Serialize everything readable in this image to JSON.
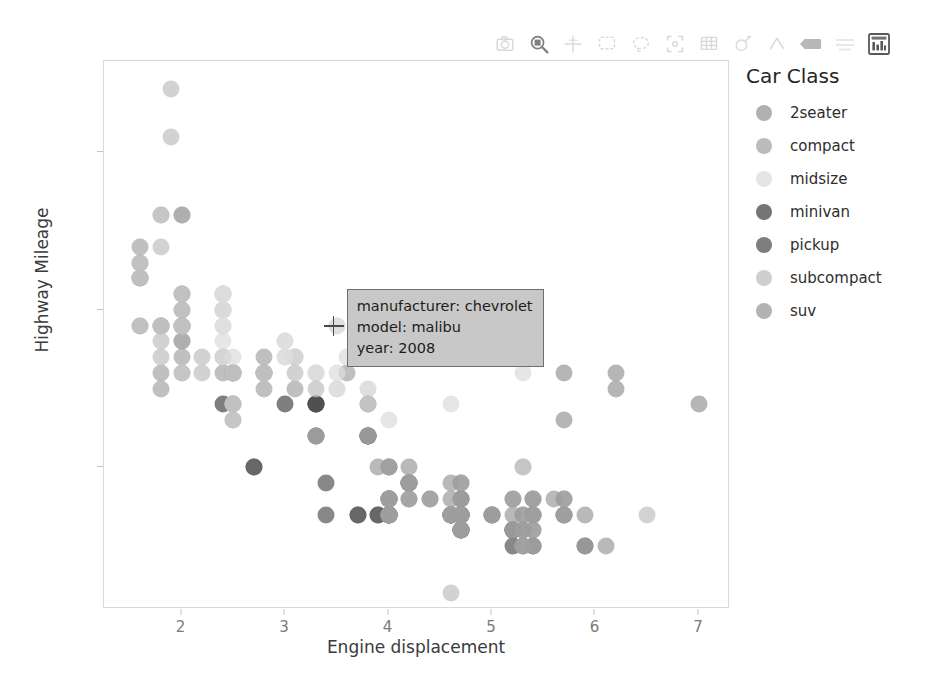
{
  "toolbar": {
    "items": [
      {
        "name": "save-icon",
        "title": "Save",
        "active": false
      },
      {
        "name": "box-zoom-icon",
        "title": "Box Zoom",
        "active": true
      },
      {
        "name": "crosshair-icon",
        "title": "Crosshair",
        "active": false
      },
      {
        "name": "box-select-icon",
        "title": "Box Select",
        "active": false
      },
      {
        "name": "lasso-select-icon",
        "title": "Lasso Select",
        "active": false
      },
      {
        "name": "reset-icon",
        "title": "Reset",
        "active": false
      },
      {
        "name": "zoom-out-icon",
        "title": "Zoom Out",
        "active": false
      },
      {
        "name": "wheel-zoom-icon",
        "title": "Wheel Zoom",
        "active": false
      },
      {
        "name": "pan-icon",
        "title": "Pan",
        "active": false
      },
      {
        "name": "hover-icon",
        "title": "Hover",
        "active": false
      },
      {
        "name": "tap-icon",
        "title": "Tap",
        "active": false
      },
      {
        "name": "bokeh-logo-icon",
        "title": "Bokeh",
        "active": false
      }
    ]
  },
  "chart_data": {
    "type": "scatter",
    "title": "",
    "xlabel": "Engine displacement",
    "ylabel": "Highway Mileage",
    "xlim": [
      1.25,
      7.3
    ],
    "ylim": [
      11.0,
      45.8
    ],
    "xticks": [
      2,
      3,
      4,
      5,
      6,
      7
    ],
    "yticks": [
      20,
      30,
      40
    ],
    "grid": false,
    "legend": {
      "title": "Car Class",
      "position": "right",
      "entries": [
        {
          "label": "2seater",
          "color": "#9a9a9a"
        },
        {
          "label": "compact",
          "color": "#a8a8a8"
        },
        {
          "label": "midsize",
          "color": "#dcdcdc"
        },
        {
          "label": "minivan",
          "color": "#4e4e4e"
        },
        {
          "label": "pickup",
          "color": "#5a5a5a"
        },
        {
          "label": "subcompact",
          "color": "#c0c0c0"
        },
        {
          "label": "suv",
          "color": "#9e9e9e"
        }
      ]
    },
    "marker": {
      "shape": "circle",
      "size_px": 17,
      "alpha": 0.72
    },
    "series": [
      {
        "name": "2seater",
        "color": "#9a9a9a",
        "points": [
          [
            5.7,
            26
          ],
          [
            5.7,
            23
          ],
          [
            6.2,
            26
          ],
          [
            6.2,
            25
          ],
          [
            7.0,
            24
          ]
        ]
      },
      {
        "name": "compact",
        "color": "#a8a8a8",
        "points": [
          [
            1.8,
            29
          ],
          [
            1.8,
            29
          ],
          [
            2.0,
            31
          ],
          [
            2.0,
            30
          ],
          [
            2.8,
            26
          ],
          [
            2.8,
            26
          ],
          [
            3.1,
            27
          ],
          [
            1.8,
            26
          ],
          [
            1.8,
            25
          ],
          [
            2.0,
            28
          ],
          [
            2.0,
            27
          ],
          [
            2.8,
            25
          ],
          [
            3.1,
            25
          ],
          [
            1.6,
            33
          ],
          [
            1.6,
            32
          ],
          [
            1.6,
            29
          ],
          [
            1.6,
            32
          ],
          [
            1.6,
            34
          ],
          [
            2.0,
            36
          ],
          [
            2.0,
            36
          ],
          [
            2.0,
            29
          ],
          [
            2.4,
            26
          ],
          [
            2.4,
            27
          ],
          [
            2.5,
            26
          ],
          [
            2.5,
            26
          ],
          [
            3.3,
            24
          ],
          [
            2.0,
            28
          ],
          [
            2.0,
            29
          ],
          [
            2.8,
            27
          ],
          [
            2.8,
            26
          ],
          [
            3.6,
            26
          ],
          [
            2.4,
            30
          ],
          [
            2.4,
            31
          ],
          [
            2.5,
            26
          ],
          [
            2.5,
            26
          ]
        ]
      },
      {
        "name": "midsize",
        "color": "#dcdcdc",
        "points": [
          [
            2.4,
            31
          ],
          [
            3.0,
            28
          ],
          [
            3.3,
            26
          ],
          [
            2.4,
            30
          ],
          [
            3.0,
            28
          ],
          [
            3.3,
            26
          ],
          [
            2.4,
            29
          ],
          [
            3.1,
            27
          ],
          [
            3.8,
            25
          ],
          [
            2.4,
            31
          ],
          [
            3.0,
            27
          ],
          [
            3.3,
            26
          ],
          [
            2.4,
            28
          ],
          [
            3.6,
            27
          ],
          [
            3.5,
            29
          ],
          [
            3.5,
            29
          ],
          [
            2.4,
            30
          ],
          [
            2.5,
            27
          ],
          [
            3.5,
            25
          ],
          [
            2.4,
            31
          ],
          [
            3.8,
            25
          ],
          [
            4.6,
            24
          ],
          [
            2.4,
            29
          ],
          [
            3.5,
            26
          ],
          [
            5.3,
            26
          ],
          [
            2.0,
            29
          ],
          [
            2.4,
            27
          ],
          [
            3.0,
            27
          ],
          [
            3.5,
            25
          ],
          [
            4.0,
            23
          ]
        ]
      },
      {
        "name": "minivan",
        "color": "#4e4e4e",
        "points": [
          [
            2.4,
            24
          ],
          [
            3.0,
            24
          ],
          [
            3.3,
            24
          ],
          [
            3.3,
            22
          ],
          [
            3.3,
            24
          ],
          [
            3.3,
            24
          ],
          [
            3.8,
            22
          ],
          [
            3.8,
            22
          ],
          [
            3.8,
            22
          ],
          [
            4.0,
            17
          ],
          [
            4.0,
            17
          ],
          [
            4.0,
            17
          ],
          [
            4.0,
            17
          ]
        ]
      },
      {
        "name": "pickup",
        "color": "#5a5a5a",
        "points": [
          [
            2.7,
            20
          ],
          [
            2.7,
            20
          ],
          [
            3.4,
            17
          ],
          [
            3.4,
            19
          ],
          [
            4.0,
            18
          ],
          [
            4.0,
            17
          ],
          [
            4.7,
            18
          ],
          [
            4.7,
            16
          ],
          [
            4.7,
            17
          ],
          [
            4.7,
            16
          ],
          [
            4.7,
            16
          ],
          [
            5.2,
            16
          ],
          [
            5.2,
            15
          ],
          [
            3.7,
            17
          ],
          [
            3.7,
            17
          ],
          [
            3.9,
            17
          ],
          [
            3.9,
            17
          ],
          [
            4.7,
            17
          ],
          [
            4.7,
            17
          ],
          [
            4.7,
            17
          ],
          [
            5.2,
            16
          ],
          [
            5.2,
            16
          ],
          [
            5.7,
            17
          ],
          [
            5.9,
            15
          ],
          [
            4.6,
            17
          ],
          [
            5.4,
            15
          ],
          [
            5.4,
            17
          ],
          [
            4.0,
            17
          ],
          [
            4.0,
            17
          ],
          [
            4.6,
            17
          ],
          [
            5.0,
            17
          ],
          [
            4.2,
            19
          ],
          [
            4.2,
            19
          ],
          [
            4.6,
            17
          ]
        ]
      },
      {
        "name": "subcompact",
        "color": "#c0c0c0",
        "points": [
          [
            1.8,
            29
          ],
          [
            1.8,
            29
          ],
          [
            2.0,
            31
          ],
          [
            2.0,
            30
          ],
          [
            2.8,
            26
          ],
          [
            2.8,
            26
          ],
          [
            3.1,
            26
          ],
          [
            1.8,
            28
          ],
          [
            1.8,
            27
          ],
          [
            2.0,
            29
          ],
          [
            2.0,
            31
          ],
          [
            2.5,
            26
          ],
          [
            2.5,
            26
          ],
          [
            3.3,
            25
          ],
          [
            1.9,
            44
          ],
          [
            2.0,
            29
          ],
          [
            2.0,
            26
          ],
          [
            2.5,
            23
          ],
          [
            2.5,
            24
          ],
          [
            1.9,
            41
          ],
          [
            2.0,
            29
          ],
          [
            2.0,
            26
          ],
          [
            2.5,
            23
          ],
          [
            2.5,
            24
          ],
          [
            4.6,
            12
          ],
          [
            5.4,
            17
          ],
          [
            5.4,
            18
          ],
          [
            1.6,
            33
          ],
          [
            1.6,
            32
          ],
          [
            1.6,
            32
          ],
          [
            1.6,
            29
          ],
          [
            1.8,
            34
          ],
          [
            1.8,
            36
          ],
          [
            1.8,
            36
          ],
          [
            2.2,
            26
          ],
          [
            2.2,
            27
          ],
          [
            2.5,
            24
          ],
          [
            2.5,
            24
          ],
          [
            3.8,
            24
          ],
          [
            4.0,
            17
          ],
          [
            4.0,
            17
          ],
          [
            3.8,
            24
          ],
          [
            3.8,
            24
          ],
          [
            5.3,
            20
          ],
          [
            5.3,
            15
          ],
          [
            5.3,
            20
          ],
          [
            5.7,
            17
          ],
          [
            6.5,
            17
          ]
        ]
      },
      {
        "name": "suv",
        "color": "#9e9e9e",
        "points": [
          [
            4.0,
            18
          ],
          [
            4.0,
            18
          ],
          [
            4.6,
            17
          ],
          [
            5.0,
            17
          ],
          [
            4.2,
            19
          ],
          [
            4.2,
            19
          ],
          [
            4.6,
            17
          ],
          [
            4.6,
            17
          ],
          [
            5.4,
            18
          ],
          [
            5.4,
            18
          ],
          [
            4.0,
            17
          ],
          [
            4.0,
            17
          ],
          [
            4.0,
            17
          ],
          [
            4.6,
            17
          ],
          [
            5.0,
            17
          ],
          [
            4.2,
            20
          ],
          [
            4.2,
            19
          ],
          [
            4.6,
            17
          ],
          [
            4.6,
            17
          ],
          [
            4.7,
            17
          ],
          [
            5.7,
            17
          ],
          [
            5.7,
            18
          ],
          [
            6.1,
            15
          ],
          [
            4.0,
            20
          ],
          [
            4.0,
            20
          ],
          [
            4.6,
            19
          ],
          [
            5.0,
            17
          ],
          [
            5.4,
            17
          ],
          [
            5.4,
            17
          ],
          [
            4.0,
            18
          ],
          [
            4.0,
            18
          ],
          [
            4.7,
            19
          ],
          [
            5.7,
            18
          ],
          [
            5.9,
            17
          ],
          [
            4.7,
            18
          ],
          [
            4.7,
            18
          ],
          [
            5.2,
            17
          ],
          [
            5.2,
            18
          ],
          [
            3.9,
            20
          ],
          [
            4.0,
            20
          ],
          [
            4.7,
            19
          ],
          [
            5.2,
            18
          ],
          [
            5.7,
            17
          ],
          [
            5.9,
            15
          ],
          [
            3.3,
            22
          ],
          [
            3.3,
            22
          ],
          [
            3.8,
            22
          ],
          [
            3.8,
            22
          ],
          [
            4.0,
            18
          ],
          [
            4.0,
            18
          ],
          [
            4.7,
            17
          ],
          [
            4.7,
            17
          ],
          [
            5.4,
            15
          ],
          [
            5.4,
            15
          ],
          [
            4.2,
            18
          ],
          [
            4.2,
            18
          ],
          [
            4.4,
            18
          ],
          [
            4.6,
            18
          ],
          [
            5.4,
            16
          ],
          [
            5.4,
            16
          ],
          [
            4.0,
            17
          ],
          [
            4.4,
            18
          ],
          [
            5.3,
            15
          ],
          [
            5.3,
            15
          ],
          [
            5.3,
            16
          ],
          [
            5.6,
            18
          ],
          [
            5.3,
            16
          ],
          [
            5.3,
            16
          ],
          [
            5.3,
            17
          ],
          [
            5.3,
            17
          ],
          [
            4.7,
            16
          ],
          [
            4.7,
            16
          ],
          [
            4.7,
            16
          ],
          [
            5.2,
            16
          ],
          [
            5.2,
            16
          ]
        ]
      }
    ],
    "tooltip": {
      "visible": true,
      "anchor_xy": [
        3.48,
        28.9
      ],
      "rows": [
        "manufacturer: chevrolet",
        "model: malibu",
        "year: 2008"
      ]
    }
  }
}
